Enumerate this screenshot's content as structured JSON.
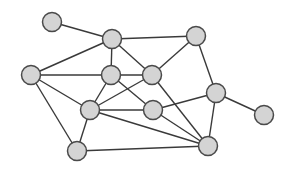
{
  "diagram": {
    "type": "undirected-graph",
    "colors": {
      "node_fill": "#d4d4d4",
      "node_stroke": "#4a4a4a",
      "edge": "#3a3a3a",
      "background": "#ffffff"
    },
    "node_radius": 9.5,
    "nodes": [
      {
        "id": "A",
        "x": 52,
        "y": 22
      },
      {
        "id": "B",
        "x": 112,
        "y": 39
      },
      {
        "id": "C",
        "x": 196,
        "y": 36
      },
      {
        "id": "D",
        "x": 31,
        "y": 75
      },
      {
        "id": "E",
        "x": 111,
        "y": 75
      },
      {
        "id": "F",
        "x": 152,
        "y": 75
      },
      {
        "id": "G",
        "x": 90,
        "y": 110
      },
      {
        "id": "H",
        "x": 153,
        "y": 110
      },
      {
        "id": "I",
        "x": 216,
        "y": 93
      },
      {
        "id": "J",
        "x": 264,
        "y": 115
      },
      {
        "id": "K",
        "x": 77,
        "y": 151
      },
      {
        "id": "L",
        "x": 208,
        "y": 146
      }
    ],
    "edges": [
      [
        "A",
        "B"
      ],
      [
        "B",
        "C"
      ],
      [
        "B",
        "D"
      ],
      [
        "B",
        "E"
      ],
      [
        "B",
        "F"
      ],
      [
        "C",
        "F"
      ],
      [
        "C",
        "I"
      ],
      [
        "D",
        "E"
      ],
      [
        "D",
        "G"
      ],
      [
        "D",
        "K"
      ],
      [
        "E",
        "F"
      ],
      [
        "E",
        "G"
      ],
      [
        "E",
        "H"
      ],
      [
        "F",
        "G"
      ],
      [
        "F",
        "L"
      ],
      [
        "G",
        "H"
      ],
      [
        "G",
        "L"
      ],
      [
        "G",
        "K"
      ],
      [
        "H",
        "I"
      ],
      [
        "H",
        "L"
      ],
      [
        "I",
        "J"
      ],
      [
        "I",
        "L"
      ],
      [
        "K",
        "L"
      ]
    ]
  }
}
